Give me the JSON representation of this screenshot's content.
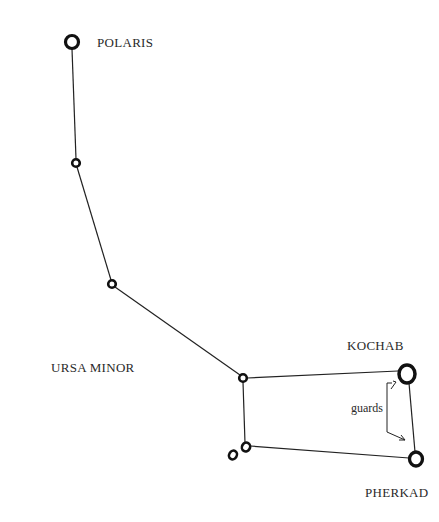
{
  "title": "URSA MINOR",
  "colors": {
    "ink": "#111111",
    "text": "#2a2a2a",
    "background": "#ffffff"
  },
  "labels": {
    "polaris": "POLARIS",
    "kochab": "KOCHAB",
    "pherkad": "PHERKAD",
    "constellation": "URSA MINOR",
    "guards": "guards"
  },
  "stars": [
    {
      "id": "polaris",
      "x": 72,
      "y": 42,
      "r": 7
    },
    {
      "id": "star2",
      "x": 76,
      "y": 163,
      "r": 4
    },
    {
      "id": "star3",
      "x": 112,
      "y": 284,
      "r": 4
    },
    {
      "id": "star4",
      "x": 243,
      "y": 378,
      "r": 4
    },
    {
      "id": "kochab",
      "x": 407,
      "y": 374,
      "r": 9
    },
    {
      "id": "pherkad",
      "x": 416,
      "y": 459,
      "r": 7
    },
    {
      "id": "star7",
      "x": 246,
      "y": 447,
      "r": 4
    },
    {
      "id": "star8",
      "x": 233,
      "y": 455,
      "r": 4
    }
  ]
}
